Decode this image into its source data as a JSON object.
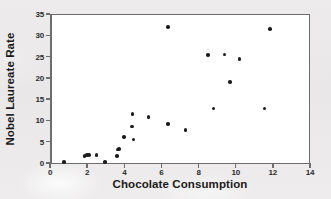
{
  "chart_data": {
    "type": "scatter",
    "title": "",
    "xlabel": "Chocolate Consumption",
    "ylabel": "Nobel Laureate Rate",
    "xlim": [
      0,
      14
    ],
    "ylim": [
      0,
      35
    ],
    "xticks": [
      0,
      2,
      4,
      6,
      8,
      10,
      12,
      14
    ],
    "yticks": [
      0,
      5,
      10,
      15,
      20,
      25,
      30,
      35
    ],
    "xtick_labels": [
      "0",
      "2",
      "4",
      "6",
      "8",
      "10",
      "12",
      "14"
    ],
    "ytick_labels": [
      "0",
      "5",
      "10",
      "15",
      "20",
      "25",
      "30",
      "35"
    ],
    "grid": false,
    "legend": null,
    "marker": "filled-circle",
    "marker_color": "#1c1c1c",
    "points": [
      {
        "x": 0.75,
        "y": 0.3
      },
      {
        "x": 1.85,
        "y": 1.6
      },
      {
        "x": 2.0,
        "y": 1.9
      },
      {
        "x": 2.1,
        "y": 1.9
      },
      {
        "x": 2.5,
        "y": 1.9
      },
      {
        "x": 2.95,
        "y": 0.25
      },
      {
        "x": 3.6,
        "y": 1.7
      },
      {
        "x": 3.65,
        "y": 3.2
      },
      {
        "x": 3.7,
        "y": 3.3
      },
      {
        "x": 4.0,
        "y": 6.1
      },
      {
        "x": 4.45,
        "y": 11.5
      },
      {
        "x": 4.4,
        "y": 8.6
      },
      {
        "x": 4.5,
        "y": 5.5
      },
      {
        "x": 5.3,
        "y": 10.8
      },
      {
        "x": 6.35,
        "y": 32.0
      },
      {
        "x": 6.35,
        "y": 9.2
      },
      {
        "x": 7.3,
        "y": 7.8
      },
      {
        "x": 8.5,
        "y": 25.4
      },
      {
        "x": 8.8,
        "y": 12.8
      },
      {
        "x": 9.4,
        "y": 25.5
      },
      {
        "x": 9.7,
        "y": 19.0
      },
      {
        "x": 10.2,
        "y": 24.4
      },
      {
        "x": 11.55,
        "y": 12.8
      },
      {
        "x": 11.85,
        "y": 31.5
      }
    ]
  }
}
